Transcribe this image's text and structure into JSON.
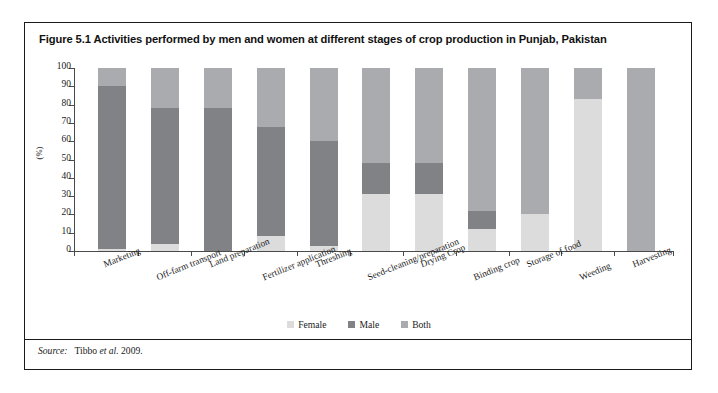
{
  "figure": {
    "title": "Figure 5.1 Activities performed by men and women at different stages of crop production in Punjab, Pakistan",
    "source_label": "Source:",
    "source_text": "Tibbo et al. 2009."
  },
  "colors": {
    "female": "#dcdcdc",
    "male": "#808285",
    "both": "#a9abae",
    "axis": "#4a4a4a",
    "border": "#1a1a1a"
  },
  "chart_data": {
    "type": "bar",
    "stacked": true,
    "title": "Figure 5.1 Activities performed by men and women at different stages of crop production in Punjab, Pakistan",
    "xlabel": "",
    "ylabel": "(%)",
    "ylim": [
      0,
      100
    ],
    "yticks": [
      0,
      10,
      20,
      30,
      40,
      50,
      60,
      70,
      80,
      90,
      100
    ],
    "grid": false,
    "legend_position": "bottom-center",
    "categories": [
      "Marketing",
      "Off-farm transport",
      "Land preparation",
      "Fertilizer application",
      "Threshing",
      "Seed-cleaning/preparation",
      "Drying Crop",
      "Binding crop",
      "Storage of food",
      "Weeding",
      "Harvesting"
    ],
    "series": [
      {
        "name": "Female",
        "color": "#dcdcdc",
        "values": [
          1,
          4,
          0,
          8,
          3,
          31,
          31,
          12,
          20,
          83,
          0
        ]
      },
      {
        "name": "Male",
        "color": "#808285",
        "values": [
          89,
          74,
          78,
          60,
          57,
          17,
          17,
          10,
          0,
          0,
          0
        ]
      },
      {
        "name": "Both",
        "color": "#a9abae",
        "values": [
          10,
          22,
          22,
          32,
          40,
          52,
          52,
          78,
          80,
          17,
          100
        ]
      }
    ]
  }
}
